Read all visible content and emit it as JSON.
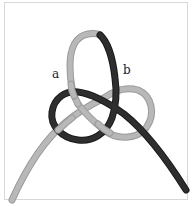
{
  "figure": {
    "type": "knot-illustration",
    "labels": {
      "a": "a",
      "b": "b"
    },
    "colors": {
      "light_rope": "#b8b8b8",
      "light_rope_edge": "#9a9a9a",
      "dark_rope": "#2e2e2e",
      "dark_rope_edge": "#1a1a1a",
      "frame": "#d8d8d8",
      "background": "#ffffff"
    }
  }
}
